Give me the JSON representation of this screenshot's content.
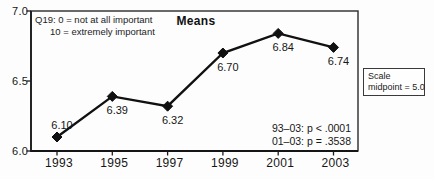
{
  "chart_data": {
    "type": "line",
    "title": "Means",
    "categories": [
      "1993",
      "1995",
      "1997",
      "1999",
      "2001",
      "2003"
    ],
    "values": [
      6.1,
      6.39,
      6.32,
      6.7,
      6.84,
      6.74
    ],
    "value_labels": [
      "6.10",
      "6.39",
      "6.32",
      "6.70",
      "6.84",
      "6.74"
    ],
    "ylim": [
      6.0,
      7.0
    ],
    "yticks": [
      "7.0",
      "6.5",
      "6.0"
    ],
    "ytick_values": [
      7.0,
      6.5,
      6.0
    ],
    "line_color": "#111111",
    "marker": "diamond",
    "grid": "off",
    "annotations": {
      "q19_line1": "Q19: 0 = not at all important",
      "q19_line2": "10 = extremely important",
      "stats_line1": "93–03: p < .0001",
      "stats_line2": "01–03: p = .3538",
      "scale_box_line1": "Scale",
      "scale_box_line2": "midpoint = 5.0"
    }
  }
}
